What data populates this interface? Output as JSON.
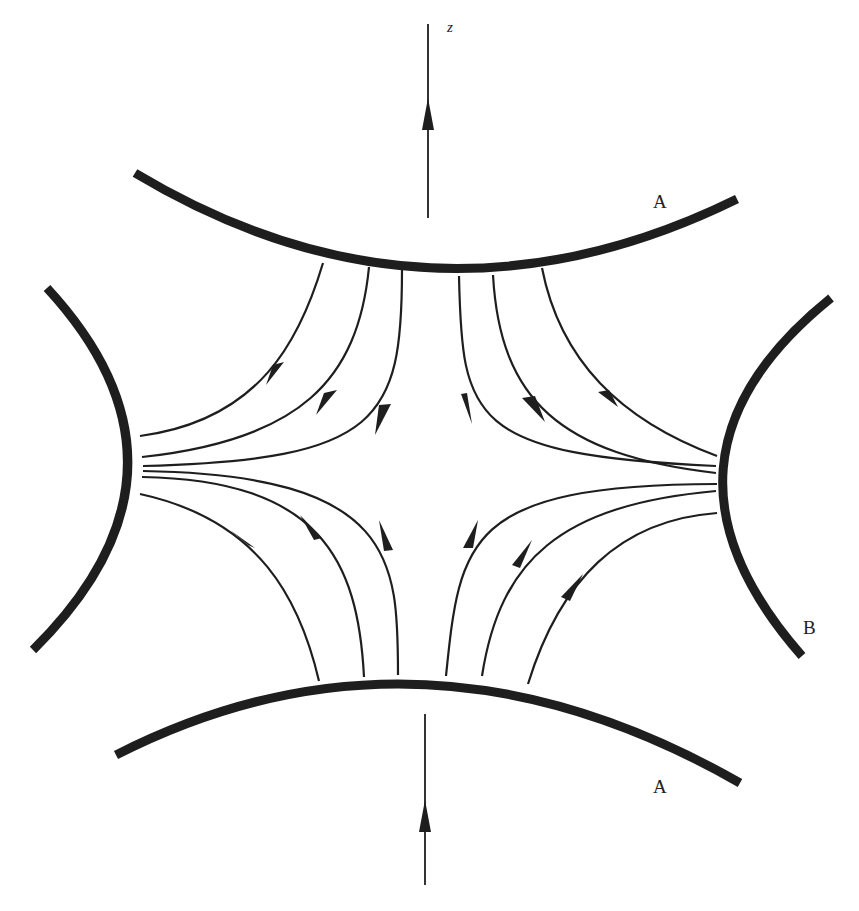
{
  "figure": {
    "axis_label": "z",
    "labels": {
      "endcap_top": "A",
      "endcap_bottom": "A",
      "ring": "B"
    },
    "colors": {
      "background": "#ffffff",
      "ink": "#1e1e1e"
    },
    "electrodes": [
      {
        "name": "endcap-top",
        "label": "A"
      },
      {
        "name": "endcap-bottom",
        "label": "A"
      },
      {
        "name": "ring-left",
        "label": ""
      },
      {
        "name": "ring-right",
        "label": "B"
      }
    ],
    "field_lines": {
      "count_per_quadrant": 3,
      "quadrants": 4,
      "direction": "from A electrodes toward B electrodes"
    }
  }
}
